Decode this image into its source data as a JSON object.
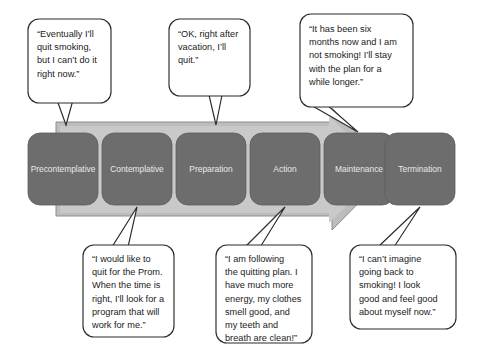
{
  "diagram": {
    "arrow": {
      "name": "progression-arrow",
      "fill_color": "#bdbdbd",
      "inner_color": "#c9c9c9",
      "direction": "left-to-right"
    },
    "stage_box_color": "#6d6d6d",
    "stage_label_color": "#e9e9e9",
    "stages": [
      {
        "id": "precontemplative",
        "label": "Precontemplative"
      },
      {
        "id": "contemplative",
        "label": "Contemplative"
      },
      {
        "id": "preparation",
        "label": "Preparation"
      },
      {
        "id": "action",
        "label": "Action"
      },
      {
        "id": "maintenance",
        "label": "Maintenance"
      },
      {
        "id": "termination",
        "label": "Termination"
      }
    ]
  },
  "callouts": {
    "precontemplative": {
      "position": "top",
      "stage": "Precontemplative",
      "lines": [
        "“Eventually I’ll",
        "quit smoking,",
        "but I can’t do it",
        "right now.”"
      ]
    },
    "contemplative": {
      "position": "bottom",
      "stage": "Contemplative",
      "lines": [
        "“I would like to",
        "quit for the Prom.",
        "When the time is",
        "right, I’ll look for a",
        "program that will",
        "work for me.”"
      ]
    },
    "preparation": {
      "position": "top",
      "stage": "Preparation",
      "lines": [
        "“OK, right after",
        "vacation, I’ll",
        "quit.”"
      ]
    },
    "action": {
      "position": "bottom",
      "stage": "Action",
      "lines": [
        "“I am following",
        "the quitting plan. I",
        "have much more",
        "energy, my clothes",
        "smell good, and",
        "my teeth and",
        "breath are clean!”"
      ]
    },
    "maintenance": {
      "position": "top",
      "stage": "Maintenance",
      "lines": [
        "“It has been six",
        "months now and I am",
        "not smoking! I’ll stay",
        "with the plan for a",
        "while longer.”"
      ]
    },
    "termination": {
      "position": "bottom",
      "stage": "Termination",
      "lines": [
        "“I can’t imagine",
        "going back to",
        "smoking! I look",
        "good and feel good",
        "about myself now.”"
      ]
    }
  }
}
